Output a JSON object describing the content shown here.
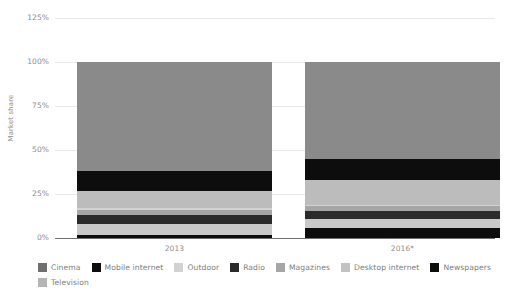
{
  "chart_data": {
    "type": "bar",
    "subtype": "stacked-percentage",
    "title": "",
    "xlabel": "",
    "ylabel": "Market share",
    "categories": [
      "2013",
      "2016*"
    ],
    "ylim": [
      0,
      125
    ],
    "yticks": [
      "0%",
      "25%",
      "50%",
      "75%",
      "100%",
      "125%"
    ],
    "ytick_values": [
      0,
      25,
      50,
      75,
      100,
      125
    ],
    "grid": true,
    "legend_position": "bottom",
    "stack_order_bottom_to_top": [
      "Newspapers",
      "Desktop internet",
      "Magazines",
      "Radio",
      "Outdoor",
      "Cinema",
      "Mobile internet",
      "Television"
    ],
    "series": [
      {
        "name": "Newspapers",
        "color": "#0d0d0d",
        "values": [
          2.0,
          7.5
        ]
      },
      {
        "name": "Desktop internet",
        "color": "#c6c6c6",
        "values": [
          6.5,
          6.0
        ]
      },
      {
        "name": "Magazines",
        "color": "#a8a8a8",
        "values": [
          1.5,
          1.5
        ]
      },
      {
        "name": "Radio",
        "color": "#2f2f2f",
        "values": [
          5.0,
          4.0
        ]
      },
      {
        "name": "Outdoor",
        "color": "#9c9c9c",
        "values": [
          4.0,
          5.0
        ]
      },
      {
        "name": "Cinema",
        "color": "#6f6f6f",
        "values": [
          1.5,
          1.0
        ]
      },
      {
        "name": "Mobile internet",
        "color": "#0d0d0d",
        "values": [
          0.0,
          0.0
        ]
      },
      {
        "name": "Television",
        "color": "#7d7d7d",
        "values": [
          79.5,
          75.0
        ]
      }
    ],
    "stacks": [
      {
        "category": "2013",
        "total": 100,
        "segments": [
          {
            "name": "Newspapers",
            "value": 1.5,
            "color": "#0d0d0d"
          },
          {
            "name": "Desktop internet",
            "value": 6.5,
            "color": "#c9c9c9"
          },
          {
            "name": "Radio",
            "value": 5.0,
            "color": "#2b2b2b"
          },
          {
            "name": "Magazines",
            "value": 3.0,
            "color": "#a6a6a6"
          },
          {
            "name": "Cinema",
            "value": 1.0,
            "color": "#d2d2d2"
          },
          {
            "name": "Outdoor",
            "value": 9.5,
            "color": "#bcbcbc"
          },
          {
            "name": "Mobile internet",
            "value": 11.5,
            "color": "#0d0d0d"
          },
          {
            "name": "Television",
            "value": 62.0,
            "color": "#8a8a8a"
          }
        ]
      },
      {
        "category": "2016*",
        "total": 100,
        "segments": [
          {
            "name": "Newspapers",
            "value": 5.5,
            "color": "#0d0d0d"
          },
          {
            "name": "Desktop internet",
            "value": 5.5,
            "color": "#c9c9c9"
          },
          {
            "name": "Radio",
            "value": 4.5,
            "color": "#2b2b2b"
          },
          {
            "name": "Magazines",
            "value": 2.5,
            "color": "#a6a6a6"
          },
          {
            "name": "Cinema",
            "value": 1.0,
            "color": "#d2d2d2"
          },
          {
            "name": "Outdoor",
            "value": 14.0,
            "color": "#bcbcbc"
          },
          {
            "name": "Mobile internet",
            "value": 12.0,
            "color": "#0d0d0d"
          },
          {
            "name": "Television",
            "value": 55.0,
            "color": "#8a8a8a"
          }
        ]
      }
    ],
    "legend": [
      {
        "label": "Cinema",
        "color": "#6f6f6f"
      },
      {
        "label": "Mobile internet",
        "color": "#0d0d0d"
      },
      {
        "label": "Outdoor",
        "color": "#d2d2d2"
      },
      {
        "label": "Radio",
        "color": "#2b2b2b"
      },
      {
        "label": "Magazines",
        "color": "#a6a6a6"
      },
      {
        "label": "Desktop internet",
        "color": "#c2c2c2"
      },
      {
        "label": "Newspapers",
        "color": "#0d0d0d"
      },
      {
        "label": "Television",
        "color": "#b5b5b5"
      }
    ]
  },
  "colors": {
    "background": "#ffffff",
    "gridline": "#e9e9e9",
    "axis": "#6f6f6f",
    "text": "#8c8c8c"
  }
}
